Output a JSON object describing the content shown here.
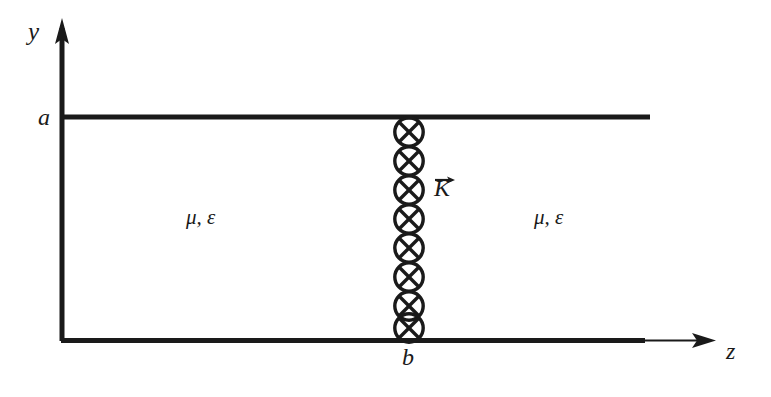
{
  "figure": {
    "background_color": "#ffffff",
    "ink_color": "#1a1a1a",
    "width": 771,
    "height": 397
  },
  "axes": {
    "vertical": {
      "label": "y",
      "name": "y-axis",
      "direction": "up",
      "has_arrowhead": true,
      "x": 62,
      "y_top": 22,
      "y_bottom": 341
    },
    "horizontal": {
      "label": "z",
      "name": "z-axis",
      "direction": "right",
      "has_arrowhead": true,
      "y": 341,
      "x_left": 62,
      "x_right": 714
    }
  },
  "plates": {
    "top": {
      "name": "top-conducting-plate",
      "tick_label": "a",
      "y": 117,
      "x_start": 62,
      "x_end": 650,
      "thickness": 5
    },
    "bottom": {
      "name": "bottom-conducting-plate",
      "tick_label": "b",
      "y": 341,
      "x_start": 62,
      "x_end": 645,
      "thickness": 5
    }
  },
  "current_sheet": {
    "name": "current-sheet-into-page",
    "symbol": "circle-with-x",
    "meaning": "current into page",
    "center_x": 409,
    "top_y": 117,
    "bottom_y": 341,
    "circle_count": 8,
    "circle_diameter": 29,
    "position_label": "b"
  },
  "vector": {
    "label": "K",
    "overline_arrow": "→",
    "name": "surface-current-vector",
    "direction": "right"
  },
  "media": {
    "left": {
      "label": "μ, ε",
      "name": "medium-left"
    },
    "right": {
      "label": "μ, ε",
      "name": "medium-right"
    }
  }
}
